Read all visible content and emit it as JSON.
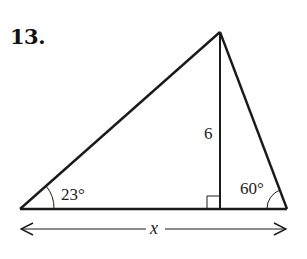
{
  "problem": {
    "number": "13."
  },
  "diagram": {
    "type": "triangle-with-altitude",
    "vertices": {
      "left": [
        20,
        209
      ],
      "apex": [
        220,
        32
      ],
      "right": [
        287,
        209
      ],
      "altitude_foot": [
        220,
        209
      ]
    },
    "labels": {
      "altitude": "6",
      "left_angle": "23°",
      "right_angle": "60°",
      "base_length": "x"
    },
    "colors": {
      "stroke": "#1a1a1a",
      "text": "#222222"
    }
  }
}
